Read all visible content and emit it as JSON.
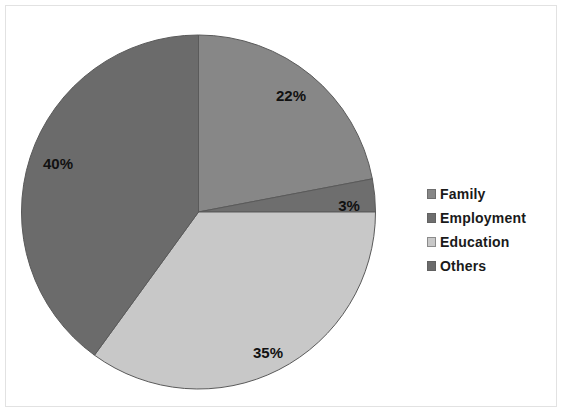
{
  "chart_data": {
    "type": "pie",
    "title": "",
    "categories": [
      "Family",
      "Employment",
      "Education",
      "Others"
    ],
    "values": [
      22,
      3,
      35,
      40
    ],
    "labels": [
      "22%",
      "3%",
      "35%",
      "40%"
    ],
    "colors": [
      "#878787",
      "#6e6e6e",
      "#c8c8c8",
      "#6b6b6b"
    ],
    "legend_position": "right",
    "grid": false,
    "start_angle_deg": 0,
    "direction": "clockwise",
    "unit": "%"
  },
  "legend": {
    "items": [
      {
        "label": "Family",
        "color": "#878787"
      },
      {
        "label": "Employment",
        "color": "#6e6e6e"
      },
      {
        "label": "Education",
        "color": "#c8c8c8"
      },
      {
        "label": "Others",
        "color": "#6b6b6b"
      }
    ]
  },
  "slice_labels": {
    "family": "22%",
    "employment": "3%",
    "education": "35%",
    "others": "40%"
  },
  "colors": {
    "background": "#ffffff",
    "frame_border": "#e2e2e2",
    "slice_outline": "#5a5a5a",
    "label_text": "#111111"
  }
}
